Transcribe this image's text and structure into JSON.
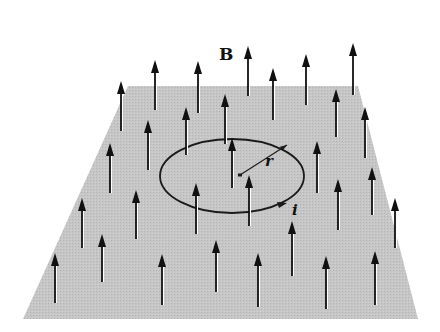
{
  "figure": {
    "labels": {
      "field": "B",
      "radius": "r",
      "current": "i"
    },
    "colors": {
      "background": "#ffffff",
      "plane": "#c4c4c4",
      "arrow": "#111111",
      "arrow_highlight": "#ffffff",
      "loop": "#1a1a1a"
    },
    "plane": {
      "corners": [
        [
          128,
          86
        ],
        [
          358,
          86
        ],
        [
          418,
          319
        ],
        [
          23,
          319
        ]
      ]
    },
    "loop": {
      "cx": 232,
      "cy": 176,
      "rx": 72,
      "ry": 37,
      "center_dot": [
        240,
        175
      ],
      "radius_end": [
        287,
        145
      ],
      "current_arrow_at": [
        280,
        206
      ]
    },
    "arrows": [
      {
        "x": 121,
        "y1": 131,
        "y2": 81
      },
      {
        "x": 155,
        "y1": 110,
        "y2": 60
      },
      {
        "x": 198,
        "y1": 113,
        "y2": 61
      },
      {
        "x": 248,
        "y1": 96,
        "y2": 46
      },
      {
        "x": 273,
        "y1": 120,
        "y2": 68
      },
      {
        "x": 306,
        "y1": 105,
        "y2": 54
      },
      {
        "x": 353,
        "y1": 95,
        "y2": 43
      },
      {
        "x": 336,
        "y1": 137,
        "y2": 89
      },
      {
        "x": 365,
        "y1": 158,
        "y2": 107
      },
      {
        "x": 148,
        "y1": 170,
        "y2": 120
      },
      {
        "x": 186,
        "y1": 155,
        "y2": 107
      },
      {
        "x": 225,
        "y1": 144,
        "y2": 94
      },
      {
        "x": 110,
        "y1": 193,
        "y2": 143
      },
      {
        "x": 232,
        "y1": 188,
        "y2": 138
      },
      {
        "x": 317,
        "y1": 193,
        "y2": 141
      },
      {
        "x": 82,
        "y1": 248,
        "y2": 198
      },
      {
        "x": 136,
        "y1": 239,
        "y2": 190
      },
      {
        "x": 196,
        "y1": 234,
        "y2": 183
      },
      {
        "x": 249,
        "y1": 226,
        "y2": 175
      },
      {
        "x": 338,
        "y1": 230,
        "y2": 179
      },
      {
        "x": 372,
        "y1": 215,
        "y2": 167
      },
      {
        "x": 395,
        "y1": 248,
        "y2": 198
      },
      {
        "x": 55,
        "y1": 303,
        "y2": 253
      },
      {
        "x": 102,
        "y1": 282,
        "y2": 234
      },
      {
        "x": 162,
        "y1": 305,
        "y2": 254
      },
      {
        "x": 216,
        "y1": 292,
        "y2": 240
      },
      {
        "x": 258,
        "y1": 307,
        "y2": 253
      },
      {
        "x": 292,
        "y1": 276,
        "y2": 221
      },
      {
        "x": 326,
        "y1": 309,
        "y2": 256
      },
      {
        "x": 375,
        "y1": 305,
        "y2": 251
      }
    ]
  }
}
